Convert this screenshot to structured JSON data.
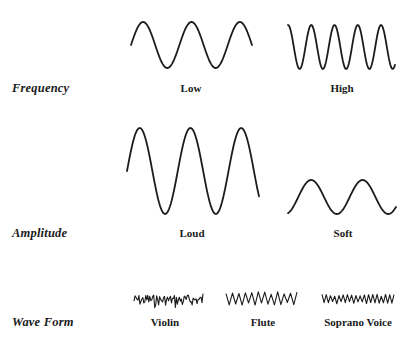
{
  "rows": [
    {
      "label": "Frequency",
      "label_y": 88,
      "caption_y": 88,
      "items": [
        {
          "caption": "Low",
          "caption_x": 191,
          "wave": {
            "type": "sine",
            "x0": 131,
            "x1": 252,
            "mid": 45,
            "amp": 23,
            "cycles": 2.5,
            "phase": 0
          }
        },
        {
          "caption": "High",
          "caption_x": 342,
          "wave": {
            "type": "sine",
            "x0": 288,
            "x1": 395,
            "mid": 47,
            "amp": 22,
            "cycles": 4.6,
            "phase": 0.25
          }
        }
      ]
    },
    {
      "label": "Amplitude",
      "label_y": 233,
      "caption_y": 233,
      "items": [
        {
          "caption": "Loud",
          "caption_x": 192,
          "wave": {
            "type": "sine",
            "x0": 127,
            "x1": 259,
            "mid": 171,
            "amp": 43,
            "cycles": 2.6,
            "phase": 0
          }
        },
        {
          "caption": "Soft",
          "caption_x": 343,
          "wave": {
            "type": "sine",
            "x0": 288,
            "x1": 396,
            "mid": 197,
            "amp": 17,
            "cycles": 2.1,
            "phase": -0.2
          }
        }
      ]
    },
    {
      "label": "Wave Form",
      "label_y": 322,
      "caption_y": 322,
      "items": [
        {
          "caption": "Violin",
          "caption_x": 165,
          "wave": {
            "type": "noise",
            "x0": 134,
            "x1": 203,
            "mid": 300,
            "amp": 9,
            "points": 70,
            "seed": 7
          }
        },
        {
          "caption": "Flute",
          "caption_x": 263,
          "wave": {
            "type": "zigzag",
            "x0": 226,
            "x1": 297,
            "mid": 298,
            "amp": 6,
            "cycles": 11,
            "seed": 3
          }
        },
        {
          "caption": "Soprano Voice",
          "caption_x": 358,
          "wave": {
            "type": "zigzag",
            "x0": 322,
            "x1": 394,
            "mid": 299,
            "amp": 4,
            "cycles": 17,
            "seed": 5
          }
        }
      ]
    }
  ]
}
